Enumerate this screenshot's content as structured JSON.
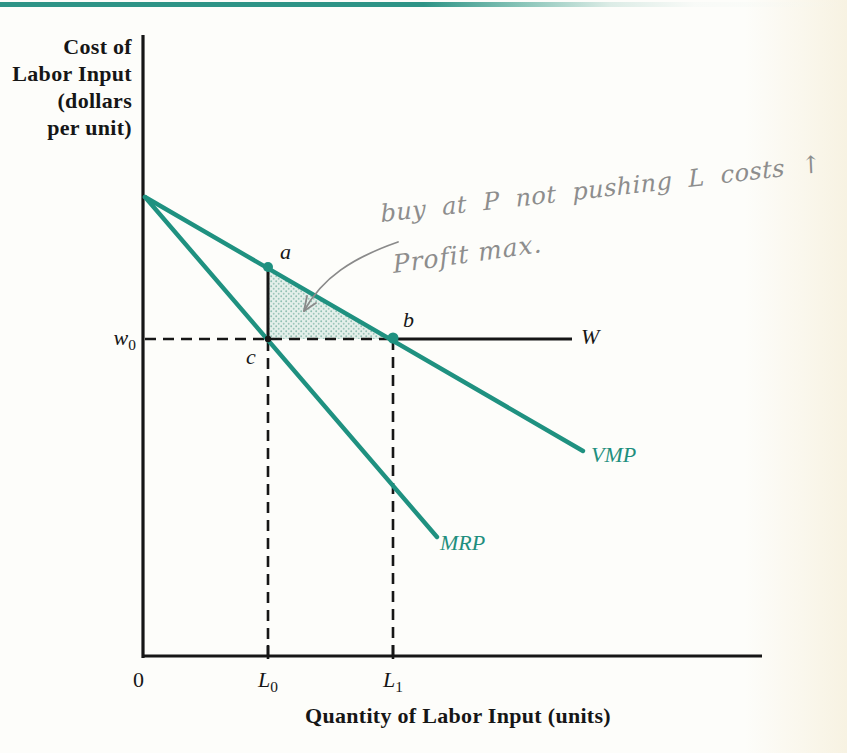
{
  "page": {
    "top_rule_color": "#2e9486",
    "background_tint": "#f7f2e2"
  },
  "chart_data": {
    "type": "line",
    "title": "",
    "xlabel": "Quantity of Labor Input (units)",
    "ylabel": "Cost of Labor Input (dollars per unit)",
    "ylabel_lines": [
      "Cost of",
      "Labor Input",
      "(dollars",
      "per unit)"
    ],
    "x_tick_labels": [
      "0",
      "L0",
      "L1"
    ],
    "y_tick_labels": [
      "w0"
    ],
    "legend_position": "inline-curve-end-labels",
    "grid": false,
    "series": [
      {
        "name": "VMP",
        "color": "#1f9180",
        "style": "solid",
        "description": "Value of marginal product: straight line falling from common y-intercept through points a (at L0) and b (at L1, wage w0)"
      },
      {
        "name": "MRP",
        "color": "#1f9180",
        "style": "solid",
        "description": "Marginal revenue product: steeper straight line from same y-intercept through point c (at L0, wage w0)"
      }
    ],
    "wage_line": {
      "label": "W",
      "level": "w0",
      "style": "dashed from axis to b, solid to the right of b"
    },
    "points": [
      {
        "label": "a",
        "x": "L0",
        "y": "VMP(L0)",
        "marker": "teal-dot"
      },
      {
        "label": "b",
        "x": "L1",
        "y": "w0",
        "marker": "teal-dot"
      },
      {
        "label": "c",
        "x": "L0",
        "y": "w0",
        "marker": "black-dot"
      }
    ],
    "shaded_region": "stippled teal triangle with vertices a, b, c",
    "dashed_guides": [
      "w0 to c to b",
      "c down to L0",
      "b down to L1"
    ],
    "geometry": {
      "teal": "#1f9180",
      "ink": "#161616",
      "y_axis": {
        "x": 143,
        "y1": 35,
        "y2": 658
      },
      "x_axis": {
        "y": 656,
        "x1": 143,
        "x2": 762
      },
      "curve_origin": [
        145,
        197
      ],
      "vmp_end": [
        583,
        451
      ],
      "mrp_end": [
        437,
        537
      ],
      "pt_a": [
        268,
        267
      ],
      "pt_b": [
        393,
        338
      ],
      "pt_c": [
        268,
        339
      ],
      "wage_y": 339,
      "wage_dash_x1": 145,
      "wage_solid_x2": 572,
      "l0_x": 268,
      "l1_x": 393,
      "tick_y1": 645,
      "tick_y2": 659,
      "arrow_color": "#8a8a8a",
      "arrow_path": "M 398 242 C 352 258 322 278 304 311",
      "arrow_head": "304,311 307,296 304,311 316,303"
    }
  },
  "labels": {
    "origin": "0",
    "l0": {
      "base": "L",
      "sub": "0"
    },
    "l1": {
      "base": "L",
      "sub": "1"
    },
    "w0": {
      "base": "w",
      "sub": "0"
    },
    "wage": "W",
    "a": "a",
    "b": "b",
    "c": "c",
    "vmp": "VMP",
    "mrp": "MRP"
  },
  "annotations": {
    "handwriting_line1": "buy at P not pushing L costs ↑",
    "handwriting_line2": "Profit max.",
    "pencil_color": "#8d8d8d",
    "arrow_target": "shaded triangle abc"
  }
}
